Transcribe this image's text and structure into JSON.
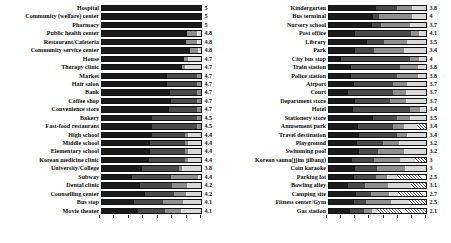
{
  "chart_data": [
    {
      "type": "bar",
      "orientation": "horizontal",
      "stacked": true,
      "panel": "left",
      "title": "",
      "xlabel": "",
      "ylabel": "",
      "grid": false,
      "legend": "none",
      "xlim": [
        0,
        100
      ],
      "value_axis_note": "mean score shown as data label at end of each bar",
      "categories": [
        "Hospital",
        "Community (welfare) center",
        "Pharmacy",
        "Public health center",
        "Restaurant/Cafeteria",
        "Community service center",
        "House",
        "Therapy clinic",
        "Market",
        "Hair salon",
        "Bank",
        "Coffee shop",
        "Convenience store",
        "Bakery",
        "Fast-food restaurant",
        "High school",
        "Middle school",
        "Elementary school",
        "Korean medicine clinic",
        "University/College",
        "Subway",
        "Dental clinic",
        "Counselling center",
        "Bus stop",
        "Movie theater"
      ],
      "values": [
        5,
        5,
        5,
        4.8,
        4.8,
        4.8,
        4.7,
        4.7,
        4.7,
        4.7,
        4.7,
        4.7,
        4.7,
        4.5,
        4.5,
        4.4,
        4.4,
        4.4,
        4.4,
        3.8,
        4.4,
        4.2,
        4.2,
        4.1,
        4.1
      ],
      "value_labels": [
        "5",
        "5",
        "5",
        "4.8",
        "4.8",
        "4.8",
        "4.7",
        "4.7",
        "4.7",
        "4.7",
        "4.7",
        "4.7",
        "4.7",
        "4.5",
        "4.5",
        "4.4",
        "4.4",
        "4.4",
        "4.4",
        "3.8",
        "4.4",
        "4.2",
        "4.2",
        "4.1",
        "4.1"
      ],
      "segments": [
        [
          100,
          0,
          0,
          0,
          0
        ],
        [
          100,
          0,
          0,
          0,
          0
        ],
        [
          100,
          0,
          0,
          0,
          0
        ],
        [
          86,
          0,
          10,
          4,
          0
        ],
        [
          85,
          0,
          11,
          4,
          0
        ],
        [
          89,
          0,
          8,
          3,
          0
        ],
        [
          83,
          0,
          4,
          13,
          0
        ],
        [
          81,
          0,
          3,
          16,
          0
        ],
        [
          66,
          30,
          4,
          0,
          0
        ],
        [
          66,
          30,
          4,
          0,
          0
        ],
        [
          69,
          27,
          4,
          0,
          0
        ],
        [
          70,
          26,
          4,
          0,
          0
        ],
        [
          68,
          28,
          4,
          0,
          0
        ],
        [
          50,
          46,
          4,
          0,
          0
        ],
        [
          50,
          46,
          4,
          0,
          0
        ],
        [
          50,
          34,
          3,
          13,
          0
        ],
        [
          48,
          36,
          3,
          13,
          0
        ],
        [
          48,
          36,
          3,
          13,
          0
        ],
        [
          47,
          37,
          3,
          13,
          0
        ],
        [
          40,
          38,
          3,
          19,
          0
        ],
        [
          30,
          40,
          27,
          3,
          0
        ],
        [
          38,
          33,
          15,
          14,
          0
        ],
        [
          43,
          30,
          12,
          15,
          0
        ],
        [
          32,
          30,
          20,
          18,
          0
        ],
        [
          36,
          28,
          16,
          20,
          0
        ]
      ],
      "axis_ticks": [
        0,
        14.3,
        28.6,
        42.9,
        57.2,
        71.5,
        85.8,
        100
      ]
    },
    {
      "type": "bar",
      "orientation": "horizontal",
      "stacked": true,
      "panel": "right",
      "title": "",
      "xlabel": "",
      "ylabel": "",
      "grid": false,
      "legend": "none",
      "xlim": [
        0,
        100
      ],
      "value_axis_note": "mean score shown as data label at end of each bar",
      "categories": [
        "Kindergarten",
        "Bus terminal",
        "Nursery school",
        "Post office",
        "Library",
        "Park",
        "City bus stop",
        "Train station",
        "Police station",
        "Airport",
        "Court",
        "Department store",
        "Hotel",
        "Stationery store",
        "Amusement park",
        "Travel destination",
        "Playground",
        "Swimming pool",
        "Korean sauna(jjim jilbang)",
        "Coin karaoke",
        "Parking lot",
        "Bowling alley",
        "Camping site",
        "Fitness center/Gym",
        "Gas station"
      ],
      "values": [
        3.8,
        4,
        3.7,
        4.1,
        3.5,
        3.4,
        4,
        3.8,
        3.8,
        3.7,
        3.7,
        3.7,
        3.4,
        3.5,
        3.4,
        3.4,
        3.2,
        3.2,
        3,
        3,
        2.5,
        3.1,
        2.7,
        2.5,
        2.1
      ],
      "value_labels": [
        "3.8",
        "4",
        "3.7",
        "4.1",
        "3.5",
        "3.4",
        "4",
        "3.8",
        "3.8",
        "3.7",
        "3.7",
        "3.7",
        "3.4",
        "3.5",
        "3.4",
        "3.4",
        "3.2",
        "3.2",
        "3",
        "3",
        "2.5",
        "3.1",
        "2.7",
        "2.5",
        "2.1"
      ],
      "segments": [
        [
          48,
          22,
          16,
          14,
          0
        ],
        [
          45,
          7,
          34,
          14,
          0
        ],
        [
          44,
          10,
          30,
          16,
          0
        ],
        [
          27,
          58,
          8,
          7,
          0
        ],
        [
          39,
          18,
          23,
          20,
          0
        ],
        [
          27,
          19,
          31,
          23,
          0
        ],
        [
          12,
          72,
          9,
          7,
          0
        ],
        [
          23,
          50,
          19,
          8,
          0
        ],
        [
          23,
          47,
          22,
          8,
          0
        ],
        [
          26,
          40,
          14,
          20,
          0
        ],
        [
          20,
          46,
          13,
          21,
          0
        ],
        [
          27,
          36,
          16,
          21,
          0
        ],
        [
          25,
          59,
          10,
          6,
          0
        ],
        [
          45,
          25,
          14,
          16,
          0
        ],
        [
          30,
          36,
          11,
          14,
          9
        ],
        [
          31,
          39,
          10,
          20,
          0
        ],
        [
          29,
          27,
          16,
          28,
          0
        ],
        [
          31,
          20,
          26,
          23,
          0
        ],
        [
          24,
          22,
          27,
          16,
          11
        ],
        [
          27,
          22,
          29,
          22,
          0
        ],
        [
          26,
          22,
          12,
          10,
          30
        ],
        [
          20,
          17,
          24,
          24,
          15
        ],
        [
          28,
          15,
          19,
          9,
          29
        ],
        [
          26,
          12,
          26,
          19,
          17
        ],
        [
          22,
          14,
          8,
          6,
          50
        ]
      ],
      "axis_ticks": [
        0,
        14.3,
        28.6,
        42.9,
        57.2,
        71.5,
        85.8,
        100
      ]
    }
  ]
}
